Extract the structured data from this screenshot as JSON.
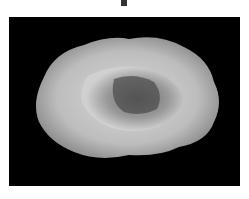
{
  "image": {
    "subject": "geode",
    "description": "Grayscale photo of a split geode with crystalline cavity on black background",
    "background_color": "#000000",
    "frame_color": "#ffffff"
  }
}
